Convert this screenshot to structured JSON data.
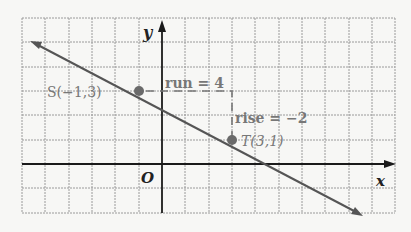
{
  "diagram": {
    "axes": {
      "x_label": "x",
      "y_label": "y",
      "origin_label": "O"
    },
    "grid": {
      "cols": 16,
      "rows": 8,
      "x_range": [
        -6,
        10
      ],
      "y_range": [
        -2,
        6
      ]
    },
    "points": [
      {
        "name": "S",
        "label": "S(−1,3)",
        "x": -1,
        "y": 3
      },
      {
        "name": "T",
        "label": "T(3,1)",
        "x": 3,
        "y": 1
      }
    ],
    "run_label": "run = 4",
    "rise_label": "rise = −2",
    "colors": {
      "grid": "#9a9a9a",
      "axis": "#1a1a1a",
      "line": "#555555",
      "point": "#6a6a6a",
      "label": "#7a7a7a"
    }
  }
}
